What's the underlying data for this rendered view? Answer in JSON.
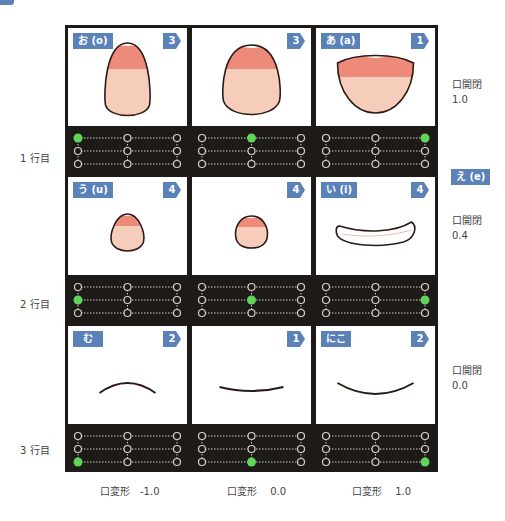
{
  "row_labels": [
    "1 行目",
    "2 行目",
    "3 行目"
  ],
  "column_labels": [
    "口変形　-1.0",
    "口変形　 0.0",
    "口変形　 1.0"
  ],
  "side_labels": [
    {
      "title": "口開閉",
      "value": "1.0"
    },
    {
      "title": "口開閉",
      "value": "0.4"
    },
    {
      "title": "口開閉",
      "value": "0.0"
    }
  ],
  "side_badge": "え (e)",
  "colors": {
    "badge": "#5a82b8",
    "active_dot": "#5fd35a",
    "panel_bg": "#1e1a18",
    "lip_top": "#ee8a7a",
    "lip_bottom": "#f6cdbb"
  },
  "cells": [
    {
      "row": 1,
      "col": 1,
      "badge": "お (o)",
      "number": "3",
      "shape": "egg-tall",
      "active": {
        "row": 1,
        "col": 1
      }
    },
    {
      "row": 1,
      "col": 2,
      "badge": "",
      "number": "3",
      "shape": "egg-wide",
      "active": {
        "row": 1,
        "col": 2
      }
    },
    {
      "row": 1,
      "col": 3,
      "badge": "あ (a)",
      "number": "1",
      "shape": "open-wide",
      "active": {
        "row": 1,
        "col": 3
      }
    },
    {
      "row": 2,
      "col": 1,
      "badge": "う (u)",
      "number": "4",
      "shape": "egg-small",
      "active": {
        "row": 2,
        "col": 1
      }
    },
    {
      "row": 2,
      "col": 2,
      "badge": "",
      "number": "4",
      "shape": "circle-small",
      "active": {
        "row": 2,
        "col": 2
      }
    },
    {
      "row": 2,
      "col": 3,
      "badge": "い (i)",
      "number": "4",
      "shape": "slit",
      "active": {
        "row": 2,
        "col": 3
      }
    },
    {
      "row": 3,
      "col": 1,
      "badge": "む",
      "number": "2",
      "shape": "frown",
      "active": {
        "row": 3,
        "col": 1
      }
    },
    {
      "row": 3,
      "col": 2,
      "badge": "",
      "number": "1",
      "shape": "flat",
      "active": {
        "row": 3,
        "col": 2
      }
    },
    {
      "row": 3,
      "col": 3,
      "badge": "にこ",
      "number": "2",
      "shape": "smile",
      "active": {
        "row": 3,
        "col": 3
      }
    }
  ]
}
